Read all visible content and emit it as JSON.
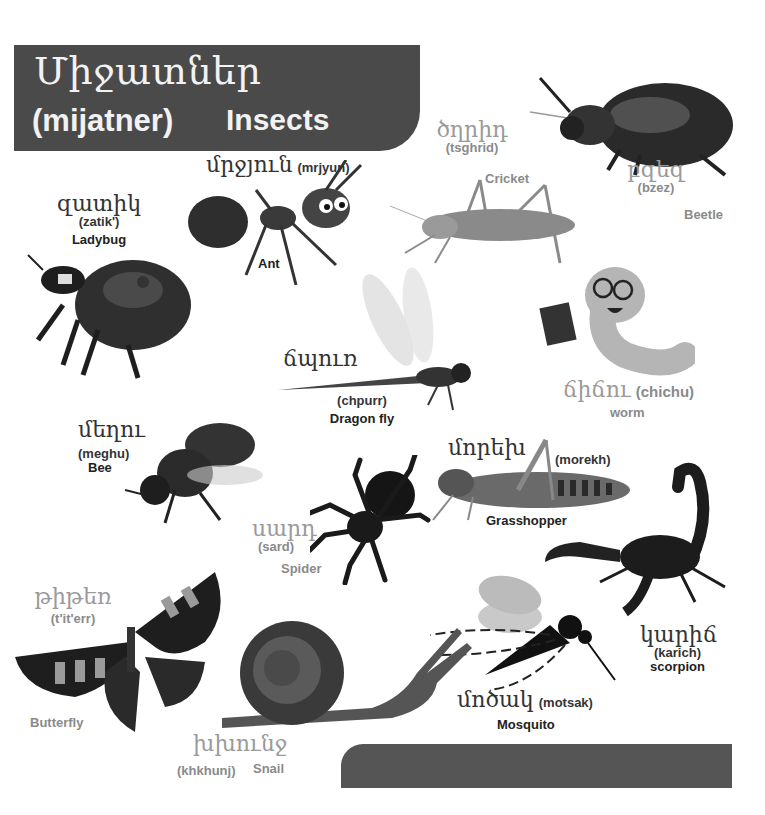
{
  "header": {
    "title_armenian": "Միջատներ",
    "title_transliteration": "(mijatner)",
    "title_english": "Insects",
    "background_color": "#4a4a4a"
  },
  "footer": {
    "bar_color": "#555555"
  },
  "insects": [
    {
      "id": "ladybug",
      "armenian": "զատիկ",
      "transliteration": "(zatik')",
      "english": "Ladybug"
    },
    {
      "id": "ant",
      "armenian": "մրջյուն",
      "transliteration": "(mrjyun)",
      "english": "Ant"
    },
    {
      "id": "cricket",
      "armenian": "ծղրիդ",
      "transliteration": "(tsghrid)",
      "english": "Cricket"
    },
    {
      "id": "beetle",
      "armenian": "բզեզ",
      "transliteration": "(bzez)",
      "english": "Beetle"
    },
    {
      "id": "worm",
      "armenian": "ճիճու",
      "transliteration": "(chichu)",
      "english": "worm"
    },
    {
      "id": "dragonfly",
      "armenian": "ճպուռ",
      "transliteration": "(chpurr)",
      "english": "Dragon fly"
    },
    {
      "id": "bee",
      "armenian": "մեղու",
      "transliteration": "(meghu)",
      "english": "Bee"
    },
    {
      "id": "grasshopper",
      "armenian": "մորեխ",
      "transliteration": "(morekh)",
      "english": "Grasshopper"
    },
    {
      "id": "spider",
      "armenian": "սարդ",
      "transliteration": "(sard)",
      "english": "Spider"
    },
    {
      "id": "scorpion",
      "armenian": "կարիճ",
      "transliteration": "(karich)",
      "english": "scorpion"
    },
    {
      "id": "butterfly",
      "armenian": "թիթեռ",
      "transliteration": "(t'it'err)",
      "english": "Butterfly"
    },
    {
      "id": "snail",
      "armenian": "խխունջ",
      "transliteration": "(khkhunj)",
      "english": "Snail"
    },
    {
      "id": "mosquito",
      "armenian": "մոծակ",
      "transliteration": "(motsak)",
      "english": "Mosquito"
    }
  ]
}
